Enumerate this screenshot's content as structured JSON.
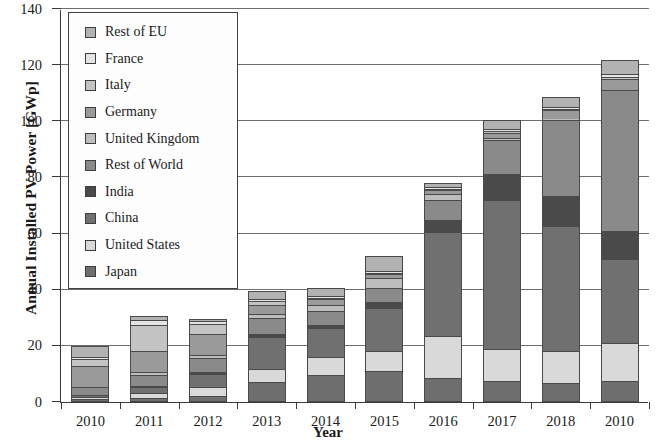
{
  "chart_data": {
    "type": "bar",
    "stacked": true,
    "title": "",
    "xlabel": "Year",
    "ylabel": "Annual Installed PV Power [GWp]",
    "ylim": [
      0,
      140
    ],
    "yticks": [
      0,
      20,
      40,
      60,
      80,
      100,
      120,
      140
    ],
    "grid": true,
    "legend_position": "upper left",
    "categories": [
      "2010",
      "2011",
      "2012",
      "2013",
      "2014",
      "2015",
      "2016",
      "2017",
      "2018",
      "2010"
    ],
    "series": [
      {
        "name": "Japan",
        "color": "#6e6e6e",
        "values": [
          1.0,
          1.3,
          2.0,
          7.0,
          9.7,
          11.0,
          8.6,
          7.5,
          6.8,
          7.5
        ]
      },
      {
        "name": "United States",
        "color": "#d9d9d9",
        "values": [
          0.9,
          1.9,
          3.4,
          4.8,
          6.2,
          7.3,
          15.0,
          11.5,
          11.5,
          13.5
        ]
      },
      {
        "name": "China",
        "color": "#707070",
        "values": [
          0.5,
          2.2,
          4.5,
          11.3,
          10.6,
          15.2,
          37.0,
          53.0,
          44.4,
          30.1
        ]
      },
      {
        "name": "India",
        "color": "#4a4a4a",
        "values": [
          0.0,
          0.3,
          0.9,
          1.1,
          0.9,
          2.0,
          4.3,
          9.3,
          10.8,
          9.9
        ]
      },
      {
        "name": "Rest of World",
        "color": "#8a8a8a",
        "values": [
          3.0,
          4.0,
          5.0,
          5.7,
          4.9,
          5.1,
          7.2,
          12.0,
          27.0,
          50.0
        ]
      },
      {
        "name": "United Kingdom",
        "color": "#bdbdbd",
        "values": [
          0.1,
          1.0,
          0.9,
          1.5,
          2.4,
          3.5,
          1.9,
          0.9,
          0.4,
          0.3
        ]
      },
      {
        "name": "Germany",
        "color": "#9a9a9a",
        "values": [
          7.4,
          7.5,
          7.6,
          3.3,
          1.9,
          1.5,
          1.5,
          1.8,
          3.0,
          3.9
        ]
      },
      {
        "name": "Italy",
        "color": "#c4c4c4",
        "values": [
          2.3,
          9.3,
          3.6,
          1.4,
          0.4,
          0.3,
          0.4,
          0.4,
          0.4,
          0.7
        ]
      },
      {
        "name": "France",
        "color": "#e4e4e4",
        "values": [
          0.7,
          1.7,
          1.1,
          0.6,
          0.9,
          0.9,
          0.6,
          0.9,
          0.9,
          0.9
        ]
      },
      {
        "name": "Rest of EU",
        "color": "#b2b2b2",
        "values": [
          4.1,
          1.3,
          0.6,
          2.8,
          2.6,
          5.2,
          1.6,
          3.1,
          3.4,
          5.2
        ]
      }
    ]
  },
  "legend": {
    "items": [
      {
        "label": "Rest of EU"
      },
      {
        "label": "France"
      },
      {
        "label": "Italy"
      },
      {
        "label": "Germany"
      },
      {
        "label": "United Kingdom"
      },
      {
        "label": "Rest of World"
      },
      {
        "label": "India"
      },
      {
        "label": "China"
      },
      {
        "label": "United States"
      },
      {
        "label": "Japan"
      }
    ]
  }
}
